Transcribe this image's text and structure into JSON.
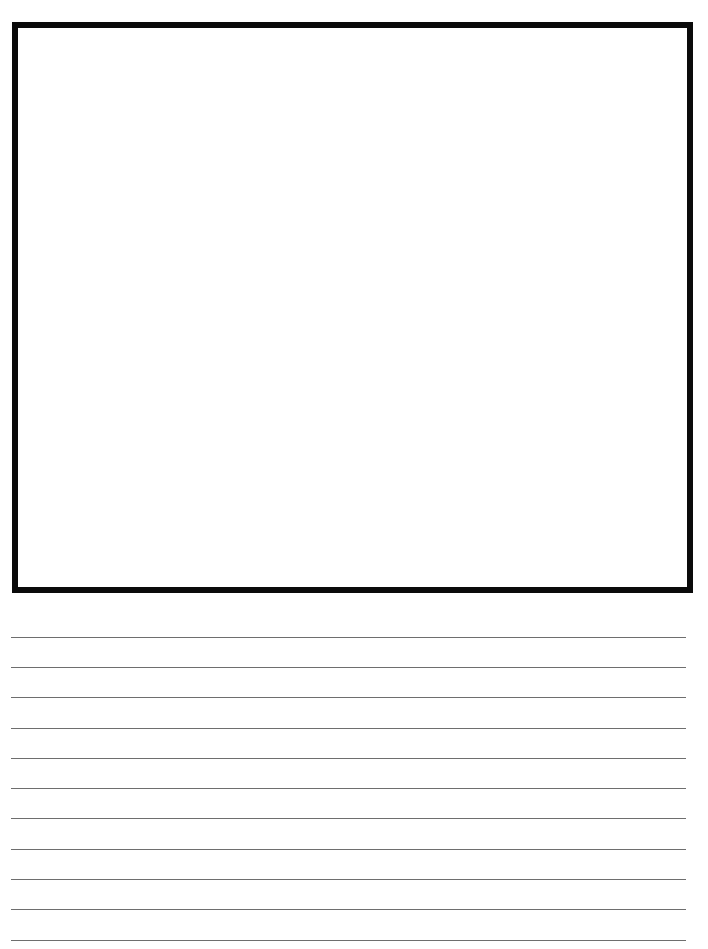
{
  "worksheet": {
    "type": "draw-and-write",
    "drawing_box": {
      "border_color": "#0a0a0a",
      "border_width": 6
    },
    "writing_lines": {
      "count": 11,
      "color": "#6e6e6e",
      "positions_y": [
        637,
        667,
        697,
        728,
        758,
        788,
        818,
        849,
        879,
        909,
        940
      ]
    }
  }
}
